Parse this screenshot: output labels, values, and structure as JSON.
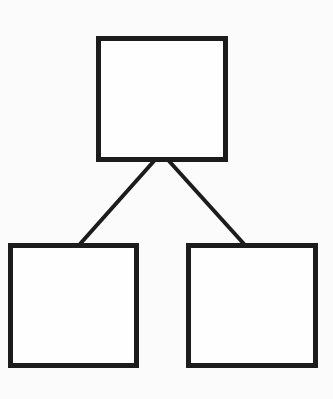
{
  "diagram": {
    "type": "tree",
    "stroke_color": "#1c1c1c",
    "fill_color": "#fefefe",
    "background_color": "#fbfbfb",
    "nodes": [
      {
        "id": "root",
        "label": "",
        "x": 96,
        "y": 36,
        "width": 132,
        "height": 126
      },
      {
        "id": "left-child",
        "label": "",
        "x": 8,
        "y": 243,
        "width": 131,
        "height": 125
      },
      {
        "id": "right-child",
        "label": "",
        "x": 186,
        "y": 243,
        "width": 132,
        "height": 125
      }
    ],
    "edges": [
      {
        "from": "root",
        "to": "left-child",
        "x1": 154,
        "y1": 161,
        "x2": 80,
        "y2": 244
      },
      {
        "from": "root",
        "to": "right-child",
        "x1": 169,
        "y1": 161,
        "x2": 244,
        "y2": 244
      }
    ]
  }
}
